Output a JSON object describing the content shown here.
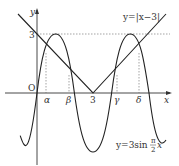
{
  "diagram": {
    "axes": {
      "x_label": "x",
      "y_label": "y",
      "origin_label": "O",
      "y_tick_label": "3",
      "x_tick_label": "3"
    },
    "curves": [
      {
        "name": "abs-line",
        "label": "y=|x−3|",
        "expression": "y=|x-3|"
      },
      {
        "name": "sine-curve",
        "label_prefix": "y=3sin",
        "frac_num": "π",
        "frac_den": "2",
        "label_suffix": "x",
        "expression": "y=3sin(pi/2 x)"
      }
    ],
    "intersections": [
      {
        "label": "α"
      },
      {
        "label": "β"
      },
      {
        "label": "γ"
      },
      {
        "label": "δ"
      }
    ],
    "colors": {
      "stroke": "#222222",
      "dashed": "#555555"
    }
  }
}
